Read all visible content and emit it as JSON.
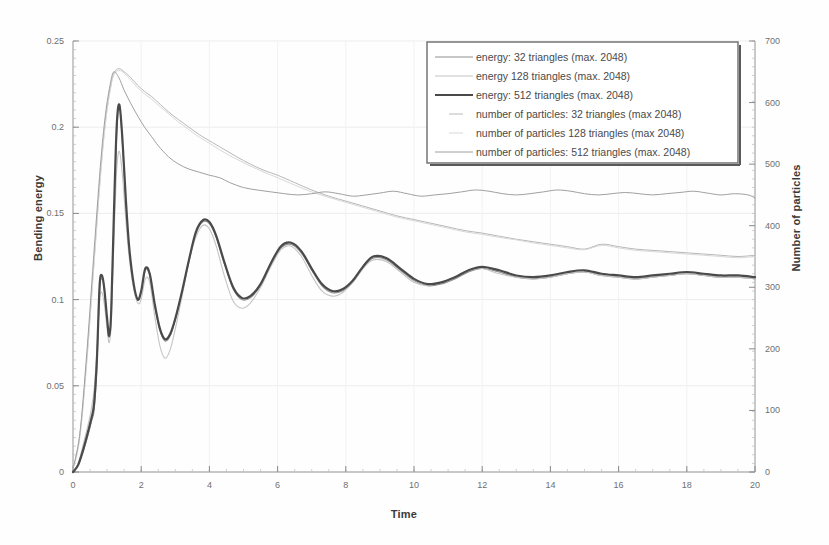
{
  "chart_data": {
    "type": "line",
    "title": "",
    "xlabel": "Time",
    "ylabel": "Bending energy",
    "ylabel_right": "Number of particles",
    "xlim": [
      0,
      20
    ],
    "ylim": [
      0,
      0.25
    ],
    "ylim_right": [
      0,
      700
    ],
    "grid": true,
    "legend_position": "top-right",
    "xticks": [
      "0",
      "2",
      "4",
      "6",
      "8",
      "10",
      "12",
      "14",
      "16",
      "18",
      "20"
    ],
    "xtick_values": [
      0,
      2,
      4,
      6,
      8,
      10,
      12,
      14,
      16,
      18,
      20
    ],
    "yticks_left": [
      "0",
      "0.05",
      "0.1",
      "0.15",
      "0.2",
      "0.25"
    ],
    "ytick_values_left": [
      0,
      0.05,
      0.1,
      0.15,
      0.2,
      0.25
    ],
    "yticks_right": [
      "0",
      "100",
      "200",
      "300",
      "400",
      "500",
      "600",
      "700"
    ],
    "ytick_values_right": [
      0,
      100,
      200,
      300,
      400,
      500,
      600,
      700
    ],
    "series": [
      {
        "name": "energy: 32 triangles (max. 2048)",
        "axis": "left",
        "color": "#8f8f8f",
        "width": 1.1,
        "x": [
          0,
          0.15,
          0.3,
          0.45,
          0.55,
          0.62,
          0.7,
          0.78,
          0.85,
          0.92,
          1.0,
          1.06,
          1.12,
          1.2,
          1.28,
          1.36,
          1.45,
          1.55,
          1.65,
          1.78,
          1.9,
          2.0,
          2.12,
          2.25,
          2.4,
          2.55,
          2.7,
          2.85,
          3.0,
          3.2,
          3.4,
          3.6,
          3.8,
          4.0,
          4.2,
          4.45,
          4.7,
          4.95,
          5.2,
          5.5,
          5.8,
          6.1,
          6.4,
          6.7,
          7.0,
          7.3,
          7.6,
          7.9,
          8.2,
          8.5,
          8.8,
          9.2,
          9.6,
          10.0,
          10.4,
          10.8,
          11.2,
          11.6,
          12.0,
          12.5,
          13.0,
          13.5,
          14.0,
          14.5,
          15.0,
          15.5,
          16.0,
          16.5,
          17.0,
          17.5,
          18.0,
          18.5,
          19.0,
          19.5,
          20.0
        ],
        "y": [
          0.0,
          0.004,
          0.012,
          0.022,
          0.03,
          0.036,
          0.06,
          0.105,
          0.112,
          0.105,
          0.088,
          0.078,
          0.09,
          0.145,
          0.195,
          0.213,
          0.19,
          0.155,
          0.128,
          0.108,
          0.1,
          0.104,
          0.117,
          0.114,
          0.096,
          0.082,
          0.076,
          0.079,
          0.088,
          0.104,
          0.122,
          0.138,
          0.145,
          0.144,
          0.136,
          0.12,
          0.106,
          0.1,
          0.101,
          0.108,
          0.12,
          0.13,
          0.132,
          0.127,
          0.117,
          0.108,
          0.104,
          0.105,
          0.11,
          0.118,
          0.124,
          0.123,
          0.117,
          0.111,
          0.108,
          0.109,
          0.112,
          0.116,
          0.118,
          0.116,
          0.113,
          0.112,
          0.113,
          0.115,
          0.116,
          0.114,
          0.113,
          0.112,
          0.113,
          0.114,
          0.115,
          0.114,
          0.113,
          0.113,
          0.112
        ]
      },
      {
        "name": "energy  128 triangles (max. 2048)",
        "axis": "left",
        "color": "#c4c4c4",
        "width": 1.1,
        "x": [
          0,
          0.15,
          0.3,
          0.45,
          0.55,
          0.62,
          0.7,
          0.78,
          0.85,
          0.92,
          1.0,
          1.06,
          1.12,
          1.2,
          1.28,
          1.36,
          1.45,
          1.55,
          1.65,
          1.78,
          1.9,
          2.0,
          2.12,
          2.25,
          2.4,
          2.55,
          2.7,
          2.85,
          3.0,
          3.2,
          3.4,
          3.6,
          3.8,
          4.0,
          4.2,
          4.45,
          4.7,
          4.95,
          5.2,
          5.5,
          5.8,
          6.1,
          6.4,
          6.7,
          7.0,
          7.3,
          7.6,
          7.9,
          8.2,
          8.5,
          8.8,
          9.2,
          9.6,
          10.0,
          10.4,
          10.8,
          11.2,
          11.6,
          12.0,
          12.5,
          13.0,
          13.5,
          14.0,
          14.5,
          15.0,
          15.5,
          16.0,
          16.5,
          17.0,
          17.5,
          18.0,
          18.5,
          19.0,
          19.5,
          20.0
        ],
        "y": [
          0.0,
          0.005,
          0.016,
          0.028,
          0.038,
          0.048,
          0.07,
          0.1,
          0.104,
          0.097,
          0.083,
          0.075,
          0.086,
          0.134,
          0.175,
          0.186,
          0.172,
          0.146,
          0.124,
          0.106,
          0.098,
          0.1,
          0.112,
          0.11,
          0.09,
          0.073,
          0.066,
          0.071,
          0.083,
          0.102,
          0.122,
          0.136,
          0.143,
          0.141,
          0.131,
          0.113,
          0.099,
          0.095,
          0.098,
          0.107,
          0.119,
          0.129,
          0.131,
          0.125,
          0.114,
          0.105,
          0.102,
          0.104,
          0.11,
          0.118,
          0.123,
          0.122,
          0.116,
          0.11,
          0.108,
          0.11,
          0.113,
          0.117,
          0.118,
          0.115,
          0.113,
          0.112,
          0.113,
          0.115,
          0.116,
          0.114,
          0.113,
          0.112,
          0.113,
          0.114,
          0.115,
          0.114,
          0.113,
          0.113,
          0.112
        ]
      },
      {
        "name": "energy: 512 triangles (max. 2048)",
        "axis": "left",
        "color": "#4a4a4a",
        "width": 2.2,
        "x": [
          0,
          0.15,
          0.3,
          0.45,
          0.55,
          0.62,
          0.7,
          0.78,
          0.85,
          0.92,
          1.0,
          1.06,
          1.12,
          1.2,
          1.28,
          1.36,
          1.45,
          1.55,
          1.65,
          1.78,
          1.9,
          2.0,
          2.12,
          2.25,
          2.4,
          2.55,
          2.7,
          2.85,
          3.0,
          3.2,
          3.4,
          3.6,
          3.8,
          4.0,
          4.2,
          4.45,
          4.7,
          4.95,
          5.2,
          5.5,
          5.8,
          6.1,
          6.4,
          6.7,
          7.0,
          7.3,
          7.6,
          7.9,
          8.2,
          8.5,
          8.8,
          9.2,
          9.6,
          10.0,
          10.4,
          10.8,
          11.2,
          11.6,
          12.0,
          12.5,
          13.0,
          13.5,
          14.0,
          14.5,
          15.0,
          15.5,
          16.0,
          16.5,
          17.0,
          17.5,
          18.0,
          18.5,
          19.0,
          19.5,
          20.0
        ],
        "y": [
          0.0,
          0.004,
          0.013,
          0.024,
          0.032,
          0.04,
          0.065,
          0.108,
          0.114,
          0.106,
          0.089,
          0.079,
          0.093,
          0.15,
          0.2,
          0.213,
          0.193,
          0.158,
          0.13,
          0.109,
          0.1,
          0.105,
          0.118,
          0.115,
          0.097,
          0.083,
          0.077,
          0.08,
          0.089,
          0.105,
          0.123,
          0.139,
          0.146,
          0.145,
          0.137,
          0.121,
          0.107,
          0.101,
          0.102,
          0.109,
          0.121,
          0.131,
          0.133,
          0.128,
          0.118,
          0.109,
          0.105,
          0.106,
          0.111,
          0.119,
          0.125,
          0.124,
          0.118,
          0.112,
          0.109,
          0.11,
          0.113,
          0.117,
          0.119,
          0.117,
          0.114,
          0.113,
          0.114,
          0.116,
          0.117,
          0.115,
          0.114,
          0.113,
          0.114,
          0.115,
          0.116,
          0.115,
          0.114,
          0.114,
          0.113
        ]
      },
      {
        "name": "number of particles: 32 triangles (max  2048)",
        "axis": "right",
        "color": "#b8b8b8",
        "width": 1.0,
        "x": [
          0,
          0.2,
          0.4,
          0.6,
          0.8,
          0.95,
          1.1,
          1.2,
          1.35,
          1.5,
          1.7,
          1.9,
          2.1,
          2.3,
          2.5,
          2.8,
          3.1,
          3.4,
          3.7,
          4.0,
          4.4,
          4.8,
          5.2,
          5.6,
          6.0,
          6.5,
          7.0,
          7.5,
          8.0,
          8.5,
          9.0,
          9.5,
          10.0,
          10.5,
          11.0,
          11.5,
          12.0,
          12.5,
          13.0,
          13.5,
          14.0,
          14.5,
          15.0,
          15.5,
          16.0,
          16.5,
          17.0,
          17.5,
          18.0,
          18.5,
          19.0,
          19.5,
          20.0
        ],
        "y": [
          5,
          60,
          180,
          330,
          480,
          570,
          625,
          648,
          655,
          650,
          640,
          628,
          618,
          610,
          600,
          585,
          572,
          560,
          548,
          538,
          525,
          512,
          500,
          490,
          482,
          470,
          458,
          448,
          440,
          432,
          424,
          416,
          410,
          404,
          398,
          392,
          388,
          383,
          378,
          374,
          370,
          366,
          362,
          370,
          366,
          362,
          360,
          358,
          356,
          354,
          352,
          350,
          352
        ]
      },
      {
        "name": "number of particles  128 triangles (max  2048)",
        "axis": "right",
        "color": "#d8d8d8",
        "width": 1.0,
        "x": [
          0,
          0.2,
          0.4,
          0.6,
          0.8,
          0.95,
          1.1,
          1.2,
          1.35,
          1.5,
          1.7,
          1.9,
          2.1,
          2.3,
          2.5,
          2.8,
          3.1,
          3.4,
          3.7,
          4.0,
          4.4,
          4.8,
          5.2,
          5.6,
          6.0,
          6.5,
          7.0,
          7.5,
          8.0,
          8.5,
          9.0,
          9.5,
          10.0,
          10.5,
          11.0,
          11.5,
          12.0,
          12.5,
          13.0,
          13.5,
          14.0,
          14.5,
          15.0,
          15.5,
          16.0,
          16.5,
          17.0,
          17.5,
          18.0,
          18.5,
          19.0,
          19.5,
          20.0
        ],
        "y": [
          5,
          55,
          175,
          325,
          475,
          565,
          622,
          645,
          652,
          648,
          636,
          624,
          614,
          606,
          596,
          582,
          568,
          556,
          544,
          534,
          520,
          508,
          497,
          487,
          478,
          466,
          455,
          446,
          438,
          430,
          422,
          414,
          408,
          402,
          396,
          390,
          386,
          381,
          377,
          372,
          368,
          364,
          361,
          368,
          364,
          360,
          358,
          356,
          354,
          352,
          350,
          348,
          350
        ]
      },
      {
        "name": "number of particles: 512 triangles (max. 2048)",
        "axis": "right",
        "color": "#a0a0a0",
        "width": 1.0,
        "x": [
          0,
          0.2,
          0.4,
          0.6,
          0.8,
          0.95,
          1.1,
          1.2,
          1.35,
          1.5,
          1.7,
          1.9,
          2.1,
          2.3,
          2.5,
          2.8,
          3.1,
          3.4,
          3.7,
          4.0,
          4.3,
          4.6,
          5.0,
          5.4,
          5.8,
          6.2,
          6.6,
          7.0,
          7.4,
          7.8,
          8.2,
          8.6,
          9.0,
          9.4,
          9.8,
          10.2,
          10.6,
          11.0,
          11.4,
          11.8,
          12.2,
          12.6,
          13.0,
          13.4,
          13.8,
          14.2,
          14.6,
          15.0,
          15.4,
          15.8,
          16.2,
          16.6,
          17.0,
          17.4,
          17.8,
          18.2,
          18.6,
          19.0,
          19.4,
          19.8,
          20.0
        ],
        "y": [
          5,
          62,
          190,
          345,
          495,
          580,
          632,
          650,
          640,
          620,
          598,
          578,
          560,
          545,
          530,
          512,
          500,
          492,
          487,
          482,
          478,
          470,
          462,
          458,
          455,
          452,
          450,
          452,
          455,
          452,
          448,
          450,
          453,
          456,
          452,
          448,
          450,
          452,
          455,
          458,
          456,
          452,
          450,
          452,
          455,
          458,
          456,
          452,
          450,
          452,
          454,
          452,
          450,
          452,
          454,
          456,
          453,
          450,
          452,
          450,
          445
        ]
      }
    ]
  },
  "legend": {
    "entries": [
      "energy: 32 triangles (max. 2048)",
      "energy  128 triangles (max. 2048)",
      "energy: 512 triangles (max. 2048)",
      "number of particles: 32 triangles (max  2048)",
      "number of particles  128 triangles (max  2048)",
      "number of particles: 512 triangles (max. 2048)"
    ]
  }
}
